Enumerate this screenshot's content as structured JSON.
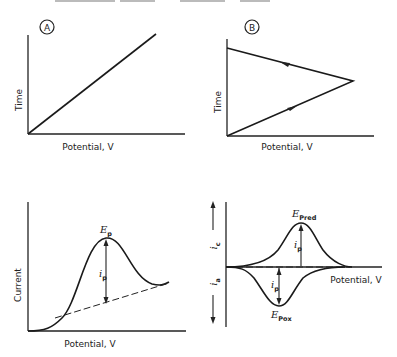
{
  "figure": {
    "type": "electrochemistry schematic: linear sweep and cyclic voltammetry",
    "panels": [
      {
        "id": "A",
        "badge": "A",
        "title": "Linear potential sweep waveform",
        "xlabel": "Potential, V",
        "ylabel": "Time"
      },
      {
        "id": "B",
        "badge": "B",
        "title": "Cyclic (triangular) potential sweep waveform",
        "xlabel": "Potential, V",
        "ylabel": "Time"
      },
      {
        "id": "C",
        "title": "Linear sweep voltammogram",
        "xlabel": "Potential, V",
        "ylabel": "Current",
        "peak_potential": {
          "symbol": "E",
          "sub": "p"
        },
        "peak_current": {
          "symbol": "i",
          "sub": "p"
        }
      },
      {
        "id": "D",
        "title": "Cyclic voltammogram",
        "xlabel": "Potential, V",
        "ylabel_upper": {
          "symbol": "i",
          "sub": "c"
        },
        "ylabel_lower": {
          "symbol": "i",
          "sub": "a"
        },
        "reduction_peak": {
          "symbol": "E",
          "sub": "Pred"
        },
        "oxidation_peak": {
          "symbol": "E",
          "sub": "Pox"
        },
        "peak_current_upper": {
          "symbol": "i",
          "sub": "p"
        },
        "peak_current_lower": {
          "symbol": "i",
          "sub": "p"
        }
      }
    ]
  }
}
